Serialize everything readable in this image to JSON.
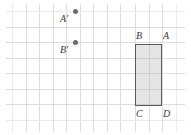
{
  "figure": {
    "background_color": "#ffffff",
    "width": 191,
    "height": 135
  },
  "grid": {
    "line_color": "#dcdcdc",
    "faint_line_color": "#ebebeb",
    "cell_width": 13.5,
    "cell_height": 15.5,
    "vertical_positions": [
      12,
      25.5,
      39,
      52.5,
      66,
      79.5,
      93,
      106.5,
      120,
      135,
      148.5,
      162,
      175.5
    ],
    "horizontal_positions": [
      11,
      26.5,
      42,
      57.5,
      73,
      88.5,
      104,
      119.5
    ]
  },
  "shape": {
    "name": "rectangle-ABCD",
    "fill_color": "#aaaaaa",
    "fill_opacity": 0.3,
    "border_color": "#595959",
    "left": 135,
    "top": 44,
    "width": 27,
    "height": 62,
    "vertices": [
      {
        "key": "b",
        "label": "B",
        "corner": "top-left"
      },
      {
        "key": "a",
        "label": "A",
        "corner": "top-right"
      },
      {
        "key": "c",
        "label": "C",
        "corner": "bottom-left"
      },
      {
        "key": "d",
        "label": "D",
        "corner": "bottom-right"
      }
    ]
  },
  "points": [
    {
      "key": "a_prime",
      "label": "A'",
      "x": 75,
      "y": 11,
      "color": "#6b6b6b"
    },
    {
      "key": "b_prime",
      "label": "B'",
      "x": 75,
      "y": 42,
      "color": "#6b6b6b"
    }
  ],
  "labels": {
    "a_prime": "A′",
    "b_prime": "B′",
    "vertex_a": "A",
    "vertex_b": "B",
    "vertex_c": "C",
    "vertex_d": "D"
  }
}
